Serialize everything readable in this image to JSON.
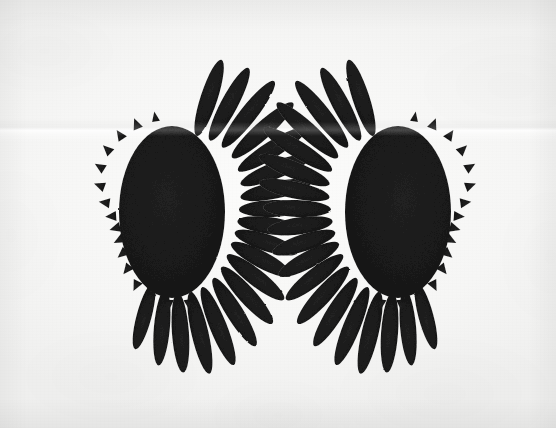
{
  "artwork": {
    "title": "Two Spiked Ovoid Forms",
    "medium": "ink drawing on paper",
    "orientation": "landscape",
    "canvas": {
      "width": 556,
      "height": 428
    },
    "background": {
      "name": "paper-sheet",
      "color": "#f8f8f7",
      "tone": "near-white paper with subtle mottling",
      "vignette": true,
      "fold": {
        "name": "horizontal-crease",
        "orientation": "horizontal",
        "y": 129,
        "description": "faint pale crease running across the full width of the sheet, visible even over the dark forms"
      }
    },
    "ink": {
      "fill": "#1a1a1a",
      "texture": "grainy / stippled charcoal black",
      "edge": "crisp matte silhouette"
    },
    "forms": [
      {
        "id": "left-form",
        "name": "spiked-ovoid-left",
        "label": "Left form",
        "center": {
          "x": 172,
          "y": 212
        },
        "body": {
          "rx": 52,
          "ry": 85
        },
        "long_spikes": {
          "side": "right",
          "count": 19,
          "length": 62,
          "tip": "rounded-taper"
        },
        "short_spikes": {
          "side": "left",
          "count": 16,
          "length": 10,
          "tip": "sawtooth"
        },
        "bounds": {
          "x": 105,
          "y": 85,
          "width": 145,
          "height": 255
        }
      },
      {
        "id": "right-form",
        "name": "spiked-ovoid-right",
        "label": "Right form",
        "center": {
          "x": 398,
          "y": 212
        },
        "body": {
          "rx": 52,
          "ry": 85
        },
        "long_spikes": {
          "side": "left",
          "count": 19,
          "length": 62,
          "tip": "rounded-taper"
        },
        "short_spikes": {
          "side": "right",
          "count": 16,
          "length": 10,
          "tip": "sawtooth"
        },
        "bounds": {
          "x": 320,
          "y": 85,
          "width": 145,
          "height": 255
        },
        "relation": "mirror image of left form"
      }
    ]
  }
}
